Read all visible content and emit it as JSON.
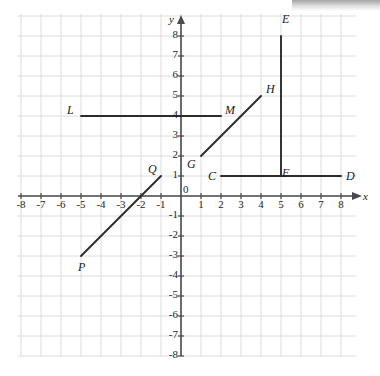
{
  "figure": {
    "type": "coordinate-grid",
    "background_color": "#ffffff",
    "grid_line_color": "#dcdcdc",
    "axis_color": "#4a4a4a",
    "segment_color": "#2b2b2b",
    "origin_px": {
      "x": 181,
      "y": 196
    },
    "cell_px": 20,
    "grid_bounds_px": {
      "left": 18,
      "top": 14,
      "right": 356,
      "bottom": 356
    }
  },
  "axes": {
    "x_label": "x",
    "y_label": "y",
    "origin_label": "0",
    "x_ticks": [
      "-8",
      "-7",
      "-6",
      "-5",
      "-4",
      "-3",
      "-2",
      "-1",
      "1",
      "2",
      "3",
      "4",
      "5",
      "6",
      "7",
      "8"
    ],
    "y_ticks": [
      "8",
      "7",
      "6",
      "5",
      "4",
      "3",
      "2",
      "1",
      "-1",
      "-2",
      "-3",
      "-4",
      "-5",
      "-6",
      "-7",
      "-8"
    ],
    "x_range": [
      -8,
      8
    ],
    "y_range": [
      -8,
      8
    ]
  },
  "chart_data": {
    "type": "scatter",
    "title": "",
    "xlabel": "x",
    "ylabel": "y",
    "xlim": [
      -8,
      8
    ],
    "ylim": [
      -8,
      8
    ],
    "grid": true,
    "segments": [
      {
        "name": "LM",
        "start_label": "L",
        "end_label": "M",
        "start": {
          "x": -5,
          "y": 4
        },
        "end": {
          "x": 2,
          "y": 4
        },
        "orientation": "horizontal"
      },
      {
        "name": "GH",
        "start_label": "G",
        "end_label": "H",
        "start": {
          "x": 1,
          "y": 2
        },
        "end": {
          "x": 4,
          "y": 5
        },
        "orientation": "diagonal"
      },
      {
        "name": "EF",
        "start_label": "E",
        "end_label": "F",
        "start": {
          "x": 5,
          "y": 8
        },
        "end": {
          "x": 5,
          "y": 1
        },
        "orientation": "vertical"
      },
      {
        "name": "CD",
        "start_label": "C",
        "end_label": "D",
        "start": {
          "x": 2,
          "y": 1
        },
        "end": {
          "x": 8,
          "y": 1
        },
        "orientation": "horizontal"
      },
      {
        "name": "PQ",
        "start_label": "P",
        "end_label": "Q",
        "start": {
          "x": -5,
          "y": -3
        },
        "end": {
          "x": -1,
          "y": 1
        },
        "orientation": "diagonal"
      }
    ],
    "point_labels": [
      {
        "text": "L",
        "x": -5,
        "y": 4,
        "dx": -14,
        "dy": -5
      },
      {
        "text": "M",
        "x": 2,
        "y": 4,
        "dx": 4,
        "dy": -5
      },
      {
        "text": "G",
        "x": 1,
        "y": 2,
        "dx": -14,
        "dy": 9
      },
      {
        "text": "H",
        "x": 4,
        "y": 5,
        "dx": 5,
        "dy": -6
      },
      {
        "text": "E",
        "x": 5,
        "y": 8,
        "dx": 1,
        "dy": -16
      },
      {
        "text": "F",
        "x": 5,
        "y": 1,
        "dx": 1,
        "dy": -2
      },
      {
        "text": "C",
        "x": 2,
        "y": 1,
        "dx": -13,
        "dy": 1
      },
      {
        "text": "D",
        "x": 8,
        "y": 1,
        "dx": 5,
        "dy": 1
      },
      {
        "text": "P",
        "x": -5,
        "y": -3,
        "dx": -3,
        "dy": 12
      },
      {
        "text": "Q",
        "x": -1,
        "y": 1,
        "dx": -13,
        "dy": -6
      }
    ]
  }
}
